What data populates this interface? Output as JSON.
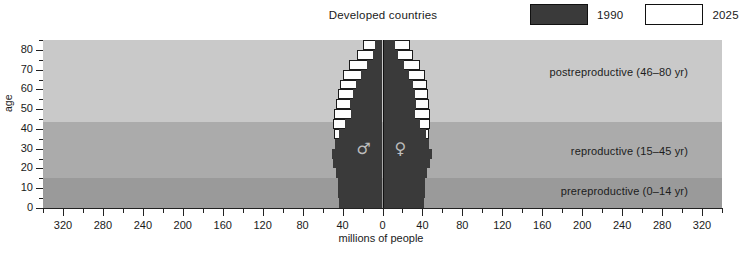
{
  "chart_title": "Developed countries",
  "legend": {
    "items": [
      {
        "label": "1990",
        "swatch": "dark",
        "color": "#3a3a3a"
      },
      {
        "label": "2025",
        "swatch": "light",
        "color": "#ffffff"
      }
    ]
  },
  "axes": {
    "y_title": "age",
    "y_ticks": [
      0,
      10,
      20,
      30,
      40,
      50,
      60,
      70,
      80
    ],
    "y_minor_step": 5,
    "y_range": [
      0,
      85
    ],
    "x_title": "millions of people",
    "x_ticks": [
      320,
      280,
      240,
      200,
      160,
      120,
      80,
      40,
      0,
      40,
      80,
      120,
      160,
      200,
      240,
      280,
      320
    ],
    "x_range": [
      -340,
      340
    ],
    "x_minor_step": 20
  },
  "bands": [
    {
      "name": "postreproductive",
      "label": "postreproductive (46–80 yr)",
      "range": [
        46,
        85
      ],
      "color": "#c9c9c9"
    },
    {
      "name": "reproductive",
      "label": "reproductive (15–45 yr)",
      "range": [
        15,
        46
      ],
      "color": "#ababab"
    },
    {
      "name": "prereproductive",
      "label": "prereproductive (0–14 yr)",
      "range": [
        0,
        15
      ],
      "color": "#9a9a9a"
    }
  ],
  "symbols": {
    "male": "♂",
    "female": "♀"
  },
  "chart_data": {
    "type": "bar",
    "title": "Developed countries",
    "xlabel": "millions of people",
    "ylabel": "age",
    "xlim": [
      -340,
      340
    ],
    "ylim": [
      0,
      85
    ],
    "grid": false,
    "legend_position": "top-right",
    "orientation": "population-pyramid",
    "note": "Horizontal back-to-back bar chart (population pyramid). Left side = males, right side = females. Values in millions of people per 5-year age cohort.",
    "age_groups": [
      "0-4",
      "5-9",
      "10-14",
      "15-19",
      "20-24",
      "25-29",
      "30-34",
      "35-39",
      "40-44",
      "45-49",
      "50-54",
      "55-59",
      "60-64",
      "65-69",
      "70-74",
      "75-79",
      "80+"
    ],
    "series": [
      {
        "name": "1990",
        "color": "#3a3a3a",
        "male": [
          44,
          45,
          45,
          47,
          50,
          51,
          48,
          44,
          38,
          32,
          33,
          30,
          27,
          22,
          16,
          10,
          7
        ],
        "female": [
          42,
          43,
          43,
          45,
          48,
          50,
          47,
          44,
          38,
          33,
          34,
          33,
          31,
          27,
          22,
          16,
          13
        ]
      },
      {
        "name": "2025",
        "color": "#ffffff",
        "male": [
          41,
          42,
          43,
          44,
          45,
          47,
          48,
          49,
          50,
          49,
          47,
          45,
          43,
          40,
          34,
          26,
          20
        ],
        "female": [
          39,
          40,
          41,
          42,
          43,
          45,
          46,
          47,
          48,
          48,
          47,
          46,
          45,
          43,
          38,
          31,
          28
        ]
      }
    ]
  }
}
